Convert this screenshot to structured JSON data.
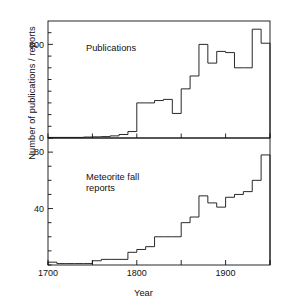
{
  "figure": {
    "axis_title_y": "Number of publications / reports",
    "axis_title_x": "Year"
  },
  "panels": {
    "top": {
      "label": "Publications",
      "ytick_labels": [
        "800",
        "0"
      ]
    },
    "bottom": {
      "label_line1": "Meteorite fall",
      "label_line2": "reports",
      "ytick_labels": [
        "80",
        "40"
      ]
    }
  },
  "xaxis": {
    "tick_labels": [
      "1700",
      "1800",
      "1900"
    ]
  },
  "colors": {
    "line": "#111111",
    "background": "#ffffff"
  },
  "chart_data": {
    "type": "line",
    "title": "",
    "subtitle": "",
    "xlabel": "Year",
    "ylabel": "Number of publications / reports",
    "grid": false,
    "legend": "none",
    "note": "Two stacked step histograms (decadal bins) sharing the Year axis. Values read off the axes; bin width 10 years.",
    "xlim": [
      1700,
      1950
    ],
    "xticks": [
      1700,
      1750,
      1800,
      1850,
      1900,
      1950
    ],
    "xtick_labels": [
      "1700",
      "",
      "1800",
      "",
      "1900",
      ""
    ],
    "panels": [
      {
        "name": "Publications",
        "ylim": [
          0,
          1000
        ],
        "yticks": [
          0,
          100,
          200,
          300,
          400,
          500,
          600,
          700,
          800,
          900
        ],
        "ytick_labels": [
          "0",
          "",
          "",
          "",
          "",
          "",
          "",
          "",
          "800",
          ""
        ],
        "labeled_yticks": [
          0,
          800
        ],
        "bin_width": 10,
        "bin_starts": [
          1700,
          1710,
          1720,
          1730,
          1740,
          1750,
          1760,
          1770,
          1780,
          1790,
          1800,
          1810,
          1820,
          1830,
          1840,
          1850,
          1860,
          1870,
          1880,
          1890,
          1900,
          1910,
          1920,
          1930,
          1940
        ],
        "values": [
          5,
          5,
          5,
          5,
          8,
          10,
          12,
          18,
          30,
          55,
          300,
          300,
          320,
          330,
          210,
          420,
          530,
          800,
          640,
          740,
          730,
          600,
          600,
          930,
          810
        ]
      },
      {
        "name": "Meteorite fall reports",
        "ylim": [
          0,
          90
        ],
        "yticks": [
          0,
          10,
          20,
          30,
          40,
          50,
          60,
          70,
          80
        ],
        "ytick_labels": [
          "",
          "",
          "",
          "",
          "40",
          "",
          "",
          "",
          "80"
        ],
        "labeled_yticks": [
          40,
          80
        ],
        "bin_width": 10,
        "bin_starts": [
          1700,
          1710,
          1720,
          1730,
          1740,
          1750,
          1760,
          1770,
          1780,
          1790,
          1800,
          1810,
          1820,
          1830,
          1840,
          1850,
          1860,
          1870,
          1880,
          1890,
          1900,
          1910,
          1920,
          1930,
          1940
        ],
        "values": [
          2,
          1,
          1,
          1,
          1,
          3,
          4,
          4,
          4,
          9,
          11,
          13,
          20,
          20,
          20,
          30,
          34,
          49,
          44,
          41,
          48,
          50,
          52,
          60,
          78,
          40
        ]
      }
    ]
  }
}
